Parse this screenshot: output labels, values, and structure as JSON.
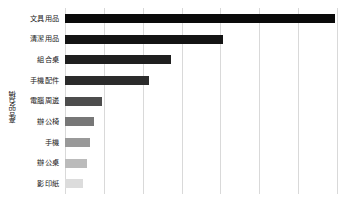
{
  "chart_data": {
    "type": "bar",
    "orientation": "horizontal",
    "title": "",
    "subtitle": "",
    "xlabel": "",
    "ylabel": "產品名稱",
    "grid": true,
    "legend": false,
    "legend_position": "none",
    "xlim": [
      0,
      7
    ],
    "xticks": [
      0,
      1,
      2,
      3,
      4,
      5,
      6,
      7
    ],
    "xtick_labels": [
      "",
      "",
      "",
      "",
      "",
      "",
      "",
      ""
    ],
    "categories": [
      "文具用品",
      "清潔用品",
      "組合桌",
      "手機配件",
      "電腦周邊",
      "辦公椅",
      "手機",
      "辦公桌",
      "影印紙"
    ],
    "values": [
      6.95,
      4.07,
      2.73,
      2.16,
      0.95,
      0.75,
      0.64,
      0.57,
      0.46
    ],
    "bar_colors": [
      "#0a0a0a",
      "#141414",
      "#1f1f1f",
      "#2b2b2b",
      "#4d4d4d",
      "#777777",
      "#999999",
      "#bbbbbb",
      "#dcdcdc"
    ],
    "value_unit": "relative bar length"
  },
  "axis": {
    "y_title": "產品名稱"
  }
}
